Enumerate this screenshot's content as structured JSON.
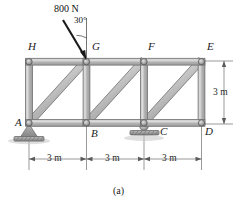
{
  "figure": {
    "caption": "(a)",
    "type": "statics-truss-free-body-diagram"
  },
  "load": {
    "magnitude_label": "800 N",
    "angle_label": "30°",
    "applied_at_joint": "G",
    "direction": "down-and-right from vertical",
    "arrow_color": "#1a1a1a"
  },
  "joints": {
    "top": [
      {
        "id": "H",
        "label": "H"
      },
      {
        "id": "G",
        "label": "G"
      },
      {
        "id": "F",
        "label": "F"
      },
      {
        "id": "E",
        "label": "E"
      }
    ],
    "bottom": [
      {
        "id": "A",
        "label": "A"
      },
      {
        "id": "B",
        "label": "B"
      },
      {
        "id": "C",
        "label": "C"
      },
      {
        "id": "D",
        "label": "D"
      }
    ]
  },
  "supports": [
    {
      "at_joint": "A",
      "kind": "pin-support"
    },
    {
      "at_joint": "C",
      "kind": "roller-support"
    }
  ],
  "dimensions": {
    "horizontal": [
      {
        "label": "3 m",
        "span": "A-B"
      },
      {
        "label": "3 m",
        "span": "B-C"
      },
      {
        "label": "3 m",
        "span": "C-D"
      }
    ],
    "vertical": [
      {
        "label": "3 m",
        "span": "E-D"
      }
    ]
  },
  "members": {
    "top_chord": [
      "H-G",
      "G-F",
      "F-E"
    ],
    "bottom_chord": [
      "A-B",
      "B-C",
      "C-D"
    ],
    "verticals": [
      "H-A",
      "G-B",
      "F-C",
      "E-D"
    ],
    "diagonals": [
      "A-G",
      "B-F",
      "C-E"
    ]
  },
  "colors": {
    "member_fill": "#b4b4b4",
    "member_stroke": "#6e6e6e",
    "member_highlight": "#d6d6d6",
    "joint_fill": "#9a9a9a",
    "joint_stroke": "#555555",
    "support_fill": "#a8a8a8",
    "dimension_line": "#6d6d6d",
    "text": "#1b1b1b",
    "background": "#ffffff"
  }
}
